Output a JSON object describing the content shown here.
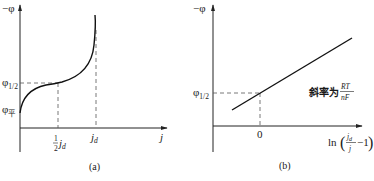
{
  "panel_a": {
    "caption": "(a)",
    "y_axis_label": "−φ",
    "x_axis_label": "j",
    "y_ticks": {
      "phi_half": {
        "main": "φ",
        "sub": "1/2"
      },
      "phi_eq": {
        "main": "φ",
        "sub": "平"
      }
    },
    "x_ticks": {
      "half_jd": {
        "num": "1",
        "den": "2",
        "main": "j",
        "sub": "d"
      },
      "jd": {
        "main": "j",
        "sub": "d"
      }
    },
    "curve_description": "S-shaped polarization curve starting at φ平, passing φ1/2 at ½jd, rising steeply near limiting current jd"
  },
  "panel_b": {
    "caption": "(b)",
    "y_axis_label": "−φ",
    "y_tick": {
      "main": "φ",
      "sub": "1/2"
    },
    "x_tick": "0",
    "x_axis_label": {
      "prefix": "ln",
      "open": "(",
      "num_main": "j",
      "num_sub": "d",
      "den": "j",
      "suffix": "−1",
      "close": ")"
    },
    "slope_label": {
      "text": "斜率为",
      "num": "RT",
      "den": "nF"
    },
    "line_description": "Straight line crossing φ1/2 at x = 0"
  },
  "colors": {
    "ink": "#111111",
    "dash": "#555555",
    "background": "#ffffff"
  }
}
